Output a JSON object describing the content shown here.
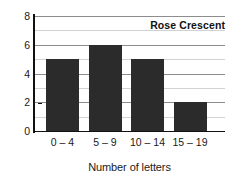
{
  "chart_data": {
    "type": "bar",
    "title": "Rose Crescent",
    "xlabel": "Number of letters",
    "ylabel": "Frequency",
    "categories": [
      "0 – 4",
      "5 – 9",
      "10 – 14",
      "15 – 19"
    ],
    "values": [
      5,
      6,
      5,
      2
    ],
    "ylim": [
      0,
      8
    ],
    "ytick_labels": [
      "0",
      "2",
      "4",
      "6",
      "8"
    ],
    "ytick_values": [
      0,
      2,
      4,
      6,
      8
    ],
    "minor_gridline_values": [
      1,
      3,
      5,
      7
    ],
    "grid": true,
    "legend": "none",
    "bar_color": "#2b2b2b",
    "gridline_color": "#8d8d8d",
    "minor_gridline_color": "#d2d2d2",
    "axis_color": "#111111",
    "background": "#ffffff"
  }
}
